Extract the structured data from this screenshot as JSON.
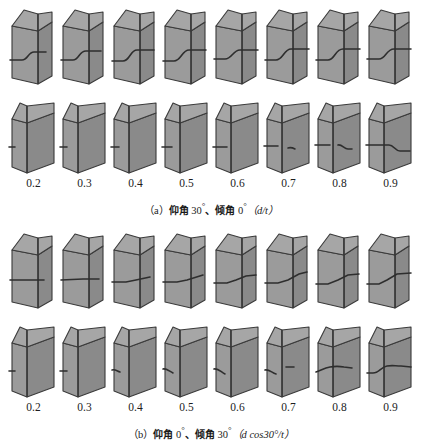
{
  "figure": {
    "background_color": "#ffffff",
    "line_color": "#3a3a3a",
    "face_front_color": "#9b9b9b",
    "face_side_color": "#8a8a8a",
    "face_top_color": "#a6a6a6",
    "columns": 8,
    "rows_per_panel": 2
  },
  "axis_labels": [
    "0.2",
    "0.3",
    "0.4",
    "0.5",
    "0.6",
    "0.7",
    "0.8",
    "0.9"
  ],
  "panels": [
    {
      "id": "panel-a",
      "caption_prefix": "（a）",
      "caption_text_1": "仰角",
      "caption_value_1": "30",
      "caption_sep": "、",
      "caption_text_2": "倾角",
      "caption_value_2": "0",
      "caption_formula": "（d/t）",
      "caption_full": "（a）仰角 30°、倾角 0°（d/t）",
      "ratio_label": "d/t"
    },
    {
      "id": "panel-b",
      "caption_prefix": "（b）",
      "caption_text_1": "仰角",
      "caption_value_1": "0",
      "caption_sep": "、",
      "caption_text_2": "倾角",
      "caption_value_2": "30",
      "caption_formula": "（d cos30°/t）",
      "caption_full": "（b）仰角 0°、倾角 30°（d cos30°/t）",
      "ratio_label": "d cos30°/t"
    }
  ],
  "chart_data": {
    "type": "diagram-grid",
    "title": "",
    "xlabel": "",
    "categories": [
      "0.2",
      "0.3",
      "0.4",
      "0.5",
      "0.6",
      "0.7",
      "0.8",
      "0.9"
    ],
    "view_rows": [
      "front-view",
      "side-view"
    ],
    "series": [
      {
        "name": "panel-a-front",
        "values": [
          0.2,
          0.3,
          0.4,
          0.5,
          0.6,
          0.7,
          0.8,
          0.9
        ]
      },
      {
        "name": "panel-a-side",
        "values": [
          0.2,
          0.3,
          0.4,
          0.5,
          0.6,
          0.7,
          0.8,
          0.9
        ]
      },
      {
        "name": "panel-b-front",
        "values": [
          0.2,
          0.3,
          0.4,
          0.5,
          0.6,
          0.7,
          0.8,
          0.9
        ]
      },
      {
        "name": "panel-b-side",
        "values": [
          0.2,
          0.3,
          0.4,
          0.5,
          0.6,
          0.7,
          0.8,
          0.9
        ]
      }
    ]
  },
  "blocks": {
    "panel-a": {
      "row-1": [
        {
          "label": "0.2",
          "crack": "M2,56 L14,56 C20,56 20,48 26,48 L38,48"
        },
        {
          "label": "0.3",
          "crack": "M2,56 L14,56 C20,56 20,47 27,47 L42,47"
        },
        {
          "label": "0.4",
          "crack": "M2,57 L13,57 C20,57 20,46 27,46 L44,46"
        },
        {
          "label": "0.5",
          "crack": "M2,57 L13,57 C20,57 21,46 28,46 L45,46"
        },
        {
          "label": "0.6",
          "crack": "M2,55 L13,55 C20,55 21,46 28,46 L46,46"
        },
        {
          "label": "0.7",
          "crack": "M2,56 L13,56 C20,56 21,45 28,45 L46,45"
        },
        {
          "label": "0.8",
          "crack": "M2,56 L14,56 C21,56 21,45 29,45 L46,45"
        },
        {
          "label": "0.9",
          "crack": "M2,55 L14,55 C21,55 21,45 29,45 L46,45"
        }
      ],
      "row-2": [
        {
          "label": "0.2",
          "crack": "M1,54 L7,54"
        },
        {
          "label": "0.3",
          "crack": "M1,54 L8,54"
        },
        {
          "label": "0.4",
          "crack": "M1,54 L9,54"
        },
        {
          "label": "0.5",
          "crack": "M1,54 L11,54"
        },
        {
          "label": "0.6",
          "crack": "M1,54 L15,54"
        },
        {
          "label": "0.7",
          "crack": "M1,53 L15,53 M25,55 C28,54 30,55 32,56"
        },
        {
          "label": "0.8",
          "crack": "M1,52 L16,52 M24,52 C28,51 30,56 34,56 L38,56"
        },
        {
          "label": "0.9",
          "crack": "M1,52 L18,52 L24,52 C29,52 30,58 35,58 L45,58"
        }
      ]
    },
    "panel-b": {
      "row-1": [
        {
          "label": "0.2",
          "crack": "M2,52 L36,52"
        },
        {
          "label": "0.3",
          "crack": "M2,52 L24,51 L40,51"
        },
        {
          "label": "0.4",
          "crack": "M2,54 L16,54 L26,52 L40,49"
        },
        {
          "label": "0.5",
          "crack": "M2,54 L16,54 L26,52 L42,47"
        },
        {
          "label": "0.6",
          "crack": "M2,55 L15,55 L24,52 L34,48 L44,47"
        },
        {
          "label": "0.7",
          "crack": "M2,55 L15,55 L25,52 L36,46 L44,44"
        },
        {
          "label": "0.8",
          "crack": "M2,56 L14,56 L24,52 L34,47 L45,46"
        },
        {
          "label": "0.9",
          "crack": "M2,56 L14,56 L22,52 L32,46 L46,45"
        }
      ],
      "row-2": [
        {
          "label": "0.2",
          "crack": "M1,54 L7,54"
        },
        {
          "label": "0.3",
          "crack": "M1,54 L8,54"
        },
        {
          "label": "0.4",
          "crack": "M2,53 C5,52 7,54 10,55"
        },
        {
          "label": "0.5",
          "crack": "M2,52 C5,51 8,54 12,56"
        },
        {
          "label": "0.6",
          "crack": "M2,52 C6,51 9,55 13,57"
        },
        {
          "label": "0.7",
          "crack": "M2,53 C6,52 9,56 13,57 M23,50 L31,50"
        },
        {
          "label": "0.8",
          "crack": "M2,55 C6,54 10,51 16,50 C22,49 24,49 30,50 L38,51"
        },
        {
          "label": "0.9",
          "crack": "M2,56 L8,56 C14,56 16,50 22,49 C28,48 30,49 36,49 L46,50"
        }
      ]
    }
  }
}
